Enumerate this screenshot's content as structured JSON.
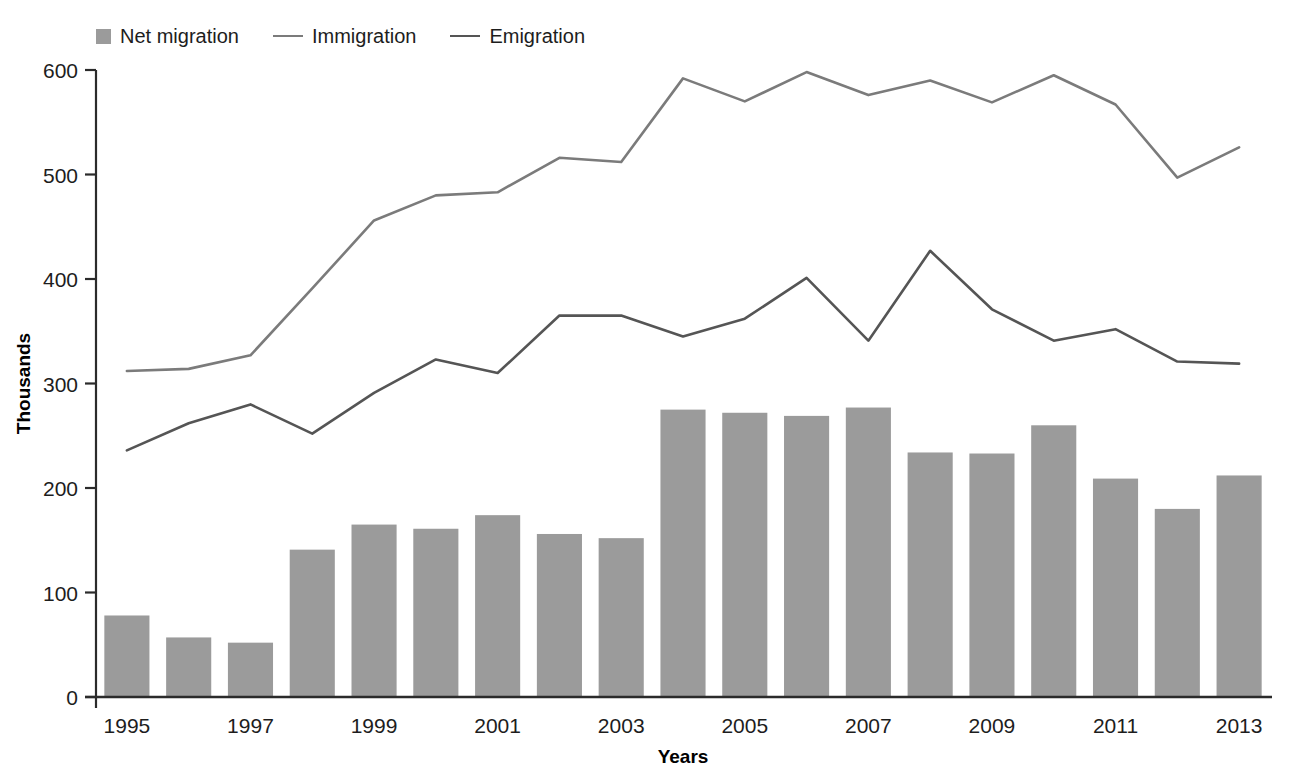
{
  "legend": {
    "items": [
      {
        "label": "Net migration",
        "marker": "square",
        "color": "#9b9b9b"
      },
      {
        "label": "Immigration",
        "marker": "line",
        "color": "#7b7b7b"
      },
      {
        "label": "Emigration",
        "marker": "line",
        "color": "#555555"
      }
    ]
  },
  "chart_data": {
    "type": "bar",
    "title": "",
    "xlabel": "Years",
    "ylabel": "Thousands",
    "categories": [
      "1995",
      "1996",
      "1997",
      "1998",
      "1999",
      "2000",
      "2001",
      "2002",
      "2003",
      "2004",
      "2005",
      "2006",
      "2007",
      "2008",
      "2009",
      "2010",
      "2011",
      "2012",
      "2013"
    ],
    "tick_labels_x": [
      "1995",
      "1997",
      "1999",
      "2001",
      "2003",
      "2005",
      "2007",
      "2009",
      "2011",
      "2013"
    ],
    "tick_labels_y": [
      "0",
      "100",
      "200",
      "300",
      "400",
      "500",
      "600"
    ],
    "ylim": [
      0,
      600
    ],
    "yticks": [
      0,
      100,
      200,
      300,
      400,
      500,
      600
    ],
    "grid": false,
    "legend_position": "top-left",
    "series": [
      {
        "name": "Net migration",
        "type": "bar",
        "color": "#9b9b9b",
        "values": [
          78,
          57,
          52,
          141,
          165,
          161,
          174,
          156,
          152,
          275,
          272,
          269,
          277,
          234,
          233,
          260,
          209,
          180,
          212
        ]
      },
      {
        "name": "Immigration",
        "type": "line",
        "color": "#7b7b7b",
        "values": [
          312,
          314,
          327,
          391,
          456,
          480,
          483,
          516,
          512,
          592,
          570,
          598,
          576,
          590,
          569,
          595,
          567,
          497,
          526
        ]
      },
      {
        "name": "Emigration",
        "type": "line",
        "color": "#555555",
        "values": [
          236,
          262,
          280,
          252,
          291,
          323,
          310,
          365,
          365,
          345,
          362,
          401,
          341,
          427,
          371,
          341,
          352,
          321,
          319
        ]
      }
    ]
  }
}
